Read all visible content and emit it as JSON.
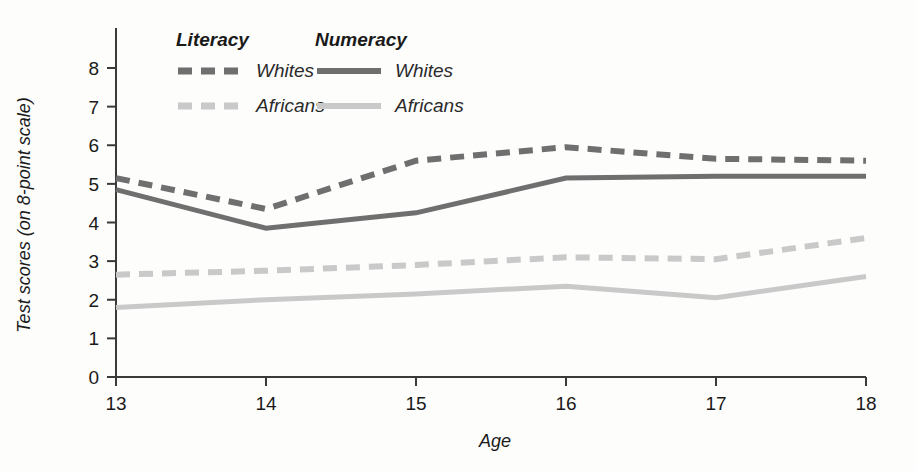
{
  "chart_data": {
    "type": "line",
    "title": "",
    "xlabel": "Age",
    "ylabel": "Test scores (on 8-point scale)",
    "x": [
      13,
      14,
      15,
      16,
      17,
      18
    ],
    "xticklabels": [
      "13",
      "14",
      "15",
      "16",
      "17",
      "18"
    ],
    "xlim": [
      13,
      18
    ],
    "ylim": [
      0,
      8
    ],
    "yticks": [
      0,
      1,
      2,
      3,
      4,
      5,
      6,
      7,
      8
    ],
    "yticklabels": [
      "0",
      "1",
      "2",
      "3",
      "4",
      "5",
      "6",
      "7",
      "8"
    ],
    "grid": false,
    "legend_position": "top-left-inside",
    "series": [
      {
        "name": "Literacy Whites",
        "group": "Literacy",
        "label": "Whites",
        "style": "dashed",
        "color": "#6f6f6f",
        "values": [
          5.15,
          4.35,
          5.6,
          5.95,
          5.65,
          5.6
        ]
      },
      {
        "name": "Literacy Africans",
        "group": "Literacy",
        "label": "Africans",
        "style": "dashed",
        "color": "#c9c9c9",
        "values": [
          2.65,
          2.75,
          2.9,
          3.1,
          3.05,
          3.6
        ]
      },
      {
        "name": "Numeracy Whites",
        "group": "Numeracy",
        "label": "Whites",
        "style": "solid",
        "color": "#6f6f6f",
        "values": [
          4.85,
          3.85,
          4.25,
          5.15,
          5.2,
          5.2
        ]
      },
      {
        "name": "Numeracy Africans",
        "group": "Numeracy",
        "label": "Africans",
        "style": "solid",
        "color": "#c9c9c9",
        "values": [
          1.8,
          2.0,
          2.15,
          2.35,
          2.05,
          2.6
        ]
      }
    ]
  },
  "legend": {
    "groups": [
      {
        "title": "Literacy",
        "entries": [
          {
            "label": "Whites",
            "color": "#6f6f6f",
            "style": "dashed"
          },
          {
            "label": "Africans",
            "color": "#c9c9c9",
            "style": "dashed"
          }
        ]
      },
      {
        "title": "Numeracy",
        "entries": [
          {
            "label": "Whites",
            "color": "#6f6f6f",
            "style": "solid"
          },
          {
            "label": "Africans",
            "color": "#c9c9c9",
            "style": "solid"
          }
        ]
      }
    ]
  },
  "axes": {
    "y_title": "Test scores (on 8-point scale)",
    "x_title": "Age"
  },
  "colors": {
    "whites": "#6f6f6f",
    "africans": "#c9c9c9",
    "axis": "#3a3a3a",
    "text": "#1a1a1a",
    "background": "#fdfdfc"
  }
}
